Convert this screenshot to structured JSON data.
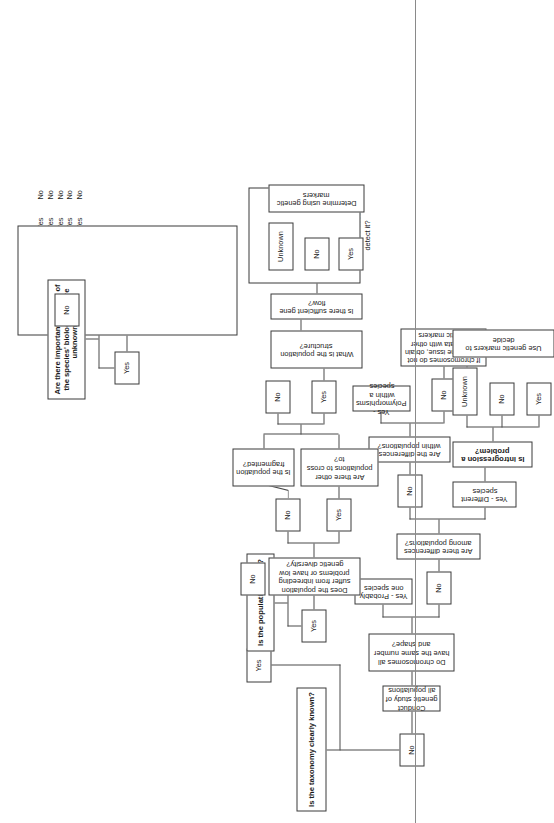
{
  "diagram": {
    "orientation": "rotated-90-ccw",
    "nodes": {
      "taxonomy": "Is the taxonomy clearly known?",
      "tax_yes": "Yes",
      "tax_no": "No",
      "conduct": "Conduct genetic study of all populations",
      "chromosomes": "Do chromosomes all have the same number and shape?",
      "chrom_yes_label": "Yes - Probably one species",
      "chrom_no": "No",
      "diff_among": "Are there differences among populations?",
      "diff_among_no": "No",
      "diff_species": "Yes - Different species",
      "diff_within": "Are the differences within populations?",
      "within_yes": "Yes - Polymorphisms within a species",
      "within_no": "No",
      "chrom_fail": "If chromosomes do not resolve the issue, obtain more data with other genetic markers",
      "introgression": "Is introgression a problem?",
      "intro_yes": "Yes",
      "intro_no": "No",
      "intro_unknown": "Unknown",
      "use_markers": "Use genetic markers to decide",
      "pop_small": "Is the population small?",
      "pop_small_yes": "Yes",
      "pop_small_no": "No",
      "inbreeding": "Does the population suffer from inbreeding problems or have low genetic diversity?",
      "inb_yes": "Yes",
      "inb_no": "No",
      "other_pops": "Are there other populations to cross to?",
      "fragmented": "Is the population fragmented?",
      "frag_yes": "Yes",
      "frag_no": "No",
      "pop_structure": "What is the population structure?",
      "gene_flow": "Is there sufficient gene flow?",
      "gf_yes": "Yes",
      "gf_no": "No",
      "gf_unknown": "Unknown",
      "determine": "Determine using genetic markers",
      "aspects": "Are there important aspects of the species' biology that are unknown?",
      "aspects_yes": "Yes",
      "aspects_no": "No",
      "hunting_title": "Is there illegal hunting or trade in the species?",
      "hunting_sub": "If yes, can genetic markers be used to detect it?"
    },
    "aspects_table": {
      "rows": [
        {
          "question": "Parentage?",
          "yes": "Yes",
          "no": "No"
        },
        {
          "question": "Mating System?",
          "yes": "Yes",
          "no": "No"
        },
        {
          "question": "Gene flow?",
          "yes": "Yes",
          "no": "No"
        },
        {
          "question": "Population size?",
          "yes": "Yes",
          "no": "No"
        },
        {
          "question": "Has the species suffered",
          "yes": "Yes",
          "no": "No"
        },
        {
          "question": "a bottleneck?",
          "yes": "",
          "no": ""
        }
      ],
      "footnote": "If yes, can genetic markers be used to provide the information?"
    },
    "colors": {
      "border": "#3a3a3a",
      "line": "#4a4a4a",
      "background": "#ffffff",
      "text": "#1a1a1a",
      "rule": "#8a8a8a"
    }
  }
}
